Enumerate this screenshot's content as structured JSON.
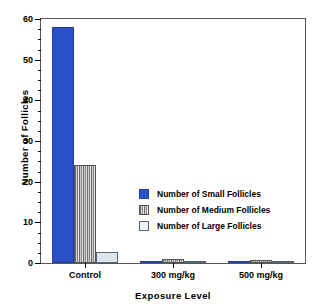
{
  "chart_data": {
    "type": "bar",
    "title": "",
    "xlabel": "Exposure  Level",
    "ylabel": "Number  of  Follicles",
    "categories": [
      "Control",
      "300 mg/kg",
      "500 mg/kg"
    ],
    "series": [
      {
        "name": "Number of Small Follicles",
        "values": [
          58,
          0.3,
          0.05
        ],
        "color": "#2b4fc4"
      },
      {
        "name": "Number of Medium Follicles",
        "values": [
          24,
          1.1,
          0.8
        ],
        "color": "#9a9a9a"
      },
      {
        "name": "Number of Large Follicles",
        "values": [
          2.7,
          0.4,
          0.5
        ],
        "color": "#dde6f1"
      }
    ],
    "ylim": [
      0,
      60
    ],
    "ymajor_ticks": [
      0,
      10,
      20,
      30,
      40,
      50,
      60
    ],
    "ytick_labels": [
      "0",
      "10",
      "20",
      "30",
      "40",
      "50",
      "60"
    ],
    "yminor_step": 2.5,
    "grid": false,
    "legend_position": "center-right",
    "legend": [
      "Number of Small Follicles",
      "Number of Medium Follicles",
      "Number of Large Follicles"
    ]
  }
}
